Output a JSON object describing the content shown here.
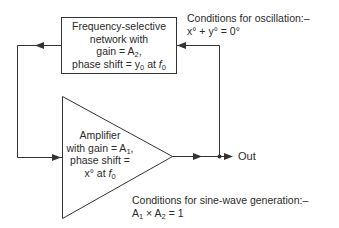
{
  "network_block": {
    "line1": "Frequency-selective",
    "line2": "network with",
    "line3_prefix": "gain = A",
    "line3_sub": "2",
    "line3_suffix": ",",
    "line4_prefix": "phase shift = y",
    "line4_sub1": "0",
    "line4_mid": " at ",
    "line4_f": "f",
    "line4_sub2": "0"
  },
  "amplifier_block": {
    "line1": "Amplifier",
    "line2_prefix": "with gain = A",
    "line2_sub": "1",
    "line2_suffix": ",",
    "line3": "phase shift =",
    "line4_prefix": "x° at ",
    "line4_f": "f",
    "line4_sub": "0"
  },
  "oscillation_conditions": {
    "title": "Conditions for oscillation:–",
    "equation": "x° + y° = 0°"
  },
  "sinewave_conditions": {
    "title": "Conditions for sine-wave generation:–",
    "eq_a1": "A",
    "eq_a1_sub": "1",
    "eq_times": " × A",
    "eq_a2_sub": "2",
    "eq_rest": " = 1"
  },
  "output_label": "Out",
  "colors": {
    "line": "#333333",
    "text": "#2b2b2b"
  }
}
